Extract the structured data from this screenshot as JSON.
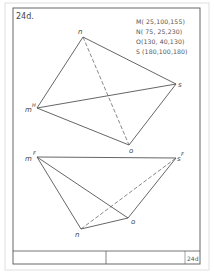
{
  "sheet": {
    "title": "24d.",
    "title_block_tag": "24d"
  },
  "given_points": [
    {
      "name": "M",
      "text": "M( 25,100,155)"
    },
    {
      "name": "N",
      "text": "N( 75, 25,230)"
    },
    {
      "name": "O",
      "text": "O(130, 40,130)"
    },
    {
      "name": "S",
      "text": "S (180,100,180)"
    }
  ],
  "top_view": {
    "labels": {
      "n": "n",
      "m": "m",
      "m_sup": "H",
      "s": "s",
      "o": "o"
    },
    "points": {
      "n": [
        83,
        37
      ],
      "m": [
        37,
        108
      ],
      "s": [
        176,
        84
      ],
      "o": [
        129,
        145
      ]
    },
    "solid_edges": [
      [
        "m",
        "n"
      ],
      [
        "n",
        "s"
      ],
      [
        "s",
        "o"
      ],
      [
        "o",
        "m"
      ],
      [
        "m",
        "s"
      ]
    ],
    "dashed_edges": [
      [
        "n",
        "o"
      ]
    ]
  },
  "front_view": {
    "labels": {
      "m": "m",
      "m_sup": "F",
      "s": "s",
      "s_sup": "F",
      "n": "n",
      "o": "o"
    },
    "points": {
      "m": [
        37,
        157
      ],
      "s": [
        176,
        158
      ],
      "n": [
        81,
        229
      ],
      "o": [
        128,
        218
      ]
    },
    "solid_edges": [
      [
        "m",
        "s"
      ],
      [
        "m",
        "n"
      ],
      [
        "n",
        "o"
      ],
      [
        "o",
        "s"
      ],
      [
        "m",
        "o"
      ]
    ],
    "dashed_edges": [
      [
        "n",
        "s"
      ]
    ]
  },
  "colors": {
    "line": "#555555",
    "frame": "#666666",
    "paper": "#ffffff"
  }
}
